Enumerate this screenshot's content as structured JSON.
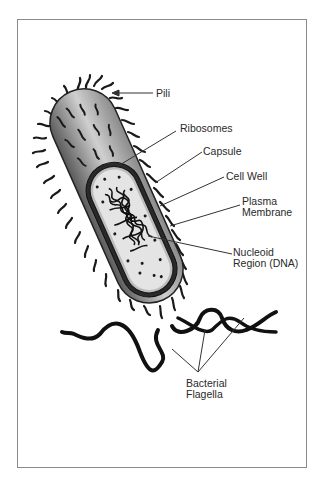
{
  "figure": {
    "labels": {
      "pili": "Pili",
      "ribosomes": "Ribosomes",
      "capsule": "Capsule",
      "cell_wall": "Cell Well",
      "plasma_membrane_line1": "Plasma",
      "plasma_membrane_line2": "Membrane",
      "nucleoid_line1": "Nucleoid",
      "nucleoid_line2": "Region (DNA)",
      "flagella_line1": "Bacterial",
      "flagella_line2": "Flagella"
    },
    "colors": {
      "frame": "#8a8a8a",
      "outline": "#1a1a1a",
      "body_dark": "#6e6e6e",
      "body_light": "#d8d8d8",
      "cytoplasm": "#e6e6e6",
      "label_text": "#2a2a2a"
    }
  }
}
